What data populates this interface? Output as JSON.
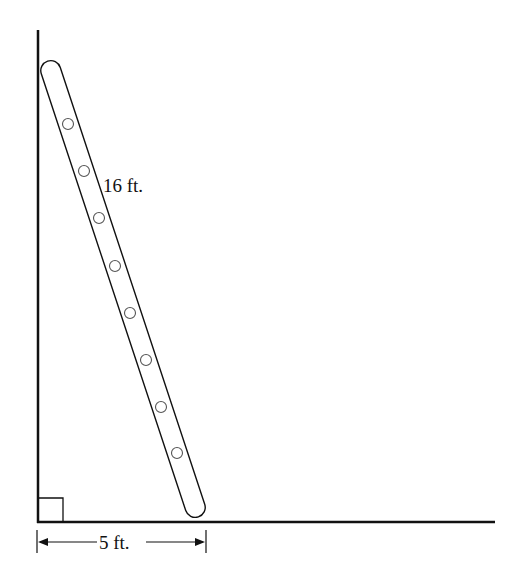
{
  "diagram": {
    "type": "ladder-against-wall",
    "labels": {
      "ladder_length": "16 ft.",
      "base_distance": "5 ft."
    },
    "right_angle_marker": true,
    "rung_count": 8,
    "colors": {
      "stroke": "#111111",
      "background": "#ffffff"
    }
  }
}
